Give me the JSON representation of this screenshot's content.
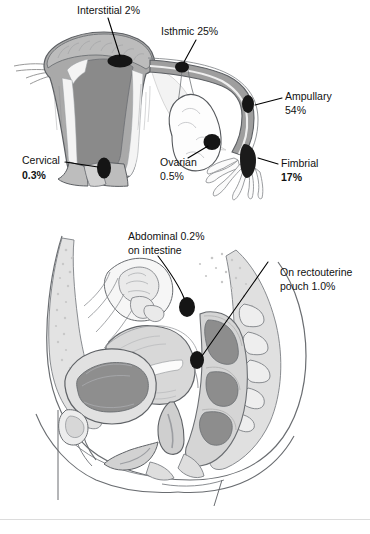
{
  "figure": {
    "panels": [
      {
        "id": "uterus-tube-panel",
        "name": "Uterus and fallopian tube cross-section",
        "labels": [
          {
            "id": "interstitial",
            "lines": [
              "Interstitial 2%"
            ],
            "percent": "2%",
            "site": "Interstitial"
          },
          {
            "id": "isthmic",
            "lines": [
              "Isthmic 25%"
            ],
            "percent": "25%",
            "site": "Isthmic"
          },
          {
            "id": "ampullary",
            "lines": [
              "Ampullary",
              "54%"
            ],
            "percent": "54%",
            "site": "Ampullary"
          },
          {
            "id": "fimbrial",
            "lines": [
              "Fimbrial",
              "17%"
            ],
            "percent": "17%",
            "site": "Fimbrial"
          },
          {
            "id": "ovarian",
            "lines": [
              "Ovarian",
              "0.5%"
            ],
            "percent": "0.5%",
            "site": "Ovarian"
          },
          {
            "id": "cervical",
            "lines": [
              "Cervical",
              "0.3%"
            ],
            "percent": "0.3%",
            "site": "Cervical"
          }
        ]
      },
      {
        "id": "pelvis-sagittal-panel",
        "name": "Female pelvis midsagittal section",
        "labels": [
          {
            "id": "abdominal",
            "lines": [
              "Abdominal 0.2%",
              "on intestine"
            ],
            "percent": "0.2%",
            "site": "Abdominal on intestine"
          },
          {
            "id": "rectouterine",
            "lines": [
              "On rectouterine",
              "pouch 1.0%"
            ],
            "percent": "1.0%",
            "site": "Rectouterine pouch"
          }
        ]
      }
    ]
  },
  "colors": {
    "marker": "#151515",
    "leader": "#000000",
    "myometrium": "#a9a9a9",
    "endometrial_cavity": "#8a8a8a",
    "lining": "#f2f2f2",
    "tube_wall": "#9e9e9e",
    "tissue_light": "#dadada",
    "tissue_mid": "#c3c3c3",
    "organ_dark": "#8f8f8f",
    "outline": "#55585c",
    "background": "#ffffff"
  },
  "footer": {
    "cropped_caption": ""
  }
}
